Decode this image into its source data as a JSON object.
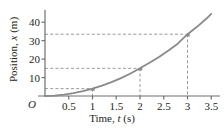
{
  "chart_data": {
    "type": "line",
    "title": "",
    "xlabel": "Time, t (s)",
    "ylabel": "Position, x (m)",
    "xlabel_prefix": "Time, ",
    "xlabel_symbol": "t",
    "xlabel_unit": " (s)",
    "ylabel_prefix": "Position, ",
    "ylabel_symbol": "x",
    "ylabel_unit": " (m)",
    "origin_label": "O",
    "xlim": [
      0,
      3.6
    ],
    "ylim": [
      0,
      45
    ],
    "grid": false,
    "legend": false,
    "x_ticks": [
      0.5,
      1,
      1.5,
      2,
      2.5,
      3,
      3.5
    ],
    "x_tick_labels": [
      "0.5",
      "1",
      "1.5",
      "2",
      "2.5",
      "3",
      "3.5"
    ],
    "y_ticks": [
      10,
      20,
      30,
      40
    ],
    "y_tick_labels": [
      "10",
      "20",
      "30",
      "40"
    ],
    "curve_color": "#8a8a8a",
    "guide_color": "#9a9a9a",
    "axis_color": "#6f6f6f",
    "x": [
      0.0,
      0.2,
      0.4,
      0.6,
      0.8,
      1.0,
      1.2,
      1.4,
      1.6,
      1.8,
      2.0,
      2.2,
      2.4,
      2.6,
      2.8,
      3.0,
      3.2,
      3.4,
      3.5
    ],
    "y": [
      0.0,
      0.2,
      0.7,
      1.5,
      2.6,
      4.0,
      5.6,
      7.5,
      9.7,
      12.2,
      15.0,
      18.0,
      21.2,
      24.7,
      28.5,
      33.5,
      37.5,
      42.0,
      44.5
    ],
    "marked_points": [
      {
        "t": 1,
        "x": 4.0
      },
      {
        "t": 2,
        "x": 15.0
      },
      {
        "t": 3,
        "x": 33.5
      }
    ],
    "guide_lines": [
      {
        "t": 1,
        "x": 4.0
      },
      {
        "t": 2,
        "x": 15.0
      },
      {
        "t": 3,
        "x": 33.5
      }
    ]
  }
}
